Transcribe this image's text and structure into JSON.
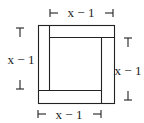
{
  "diagram": {
    "labels": {
      "top": "x − 1",
      "left": "x − 1",
      "right": "x − 1",
      "bottom": "x − 1"
    },
    "colors": {
      "stroke": "#222222",
      "background": "#ffffff"
    }
  }
}
